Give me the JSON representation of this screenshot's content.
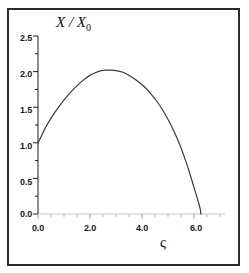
{
  "figure": {
    "background_color": "#ffffff",
    "frame_color": "#2b2b2b",
    "axis_color": "#1c1c1c",
    "xaxis_color": "#b9b9b9",
    "curve_color": "#3a3a3a"
  },
  "chart_data": {
    "type": "line",
    "title": "",
    "subtitle": "",
    "xlabel": "ς",
    "ylabel": "X / X₀",
    "xlim": [
      0.0,
      6.6
    ],
    "ylim": [
      0.0,
      2.5
    ],
    "xticks": [
      0.0,
      2.0,
      4.0,
      6.0
    ],
    "xtick_labels": [
      "0.0",
      "2.0",
      "4.0",
      "6.0"
    ],
    "xminor_step": 0.5,
    "yticks": [
      0.0,
      0.5,
      1.0,
      1.5,
      2.0,
      2.5
    ],
    "ytick_labels": [
      "0.0",
      "0.5",
      "1.0",
      "1.5",
      "2.0",
      "2.5"
    ],
    "yminor_step": 0.25,
    "grid": false,
    "legend": null,
    "legend_position": "none",
    "annotations": [],
    "series": [
      {
        "name": "X / X₀",
        "x": [
          0.0,
          0.15,
          0.3,
          0.45,
          0.6,
          0.8,
          1.0,
          1.2,
          1.4,
          1.6,
          1.8,
          2.0,
          2.2,
          2.4,
          2.6,
          2.8,
          3.0,
          3.2,
          3.4,
          3.6,
          3.8,
          4.0,
          4.2,
          4.4,
          4.6,
          4.8,
          5.0,
          5.2,
          5.35,
          5.5,
          5.6,
          5.68,
          5.73,
          5.75
        ],
        "y": [
          1.0,
          1.12,
          1.24,
          1.34,
          1.43,
          1.54,
          1.64,
          1.73,
          1.81,
          1.88,
          1.94,
          1.98,
          2.01,
          2.02,
          2.02,
          2.01,
          1.99,
          1.95,
          1.9,
          1.84,
          1.77,
          1.68,
          1.58,
          1.46,
          1.32,
          1.16,
          0.98,
          0.76,
          0.58,
          0.38,
          0.25,
          0.14,
          0.06,
          0.0
        ]
      }
    ],
    "notable_points": {
      "start": {
        "x": 0.0,
        "y": 1.0
      },
      "peak": {
        "x": 2.5,
        "y": 2.02
      },
      "end": {
        "x": 5.75,
        "y": 0.0
      }
    }
  },
  "axes": {
    "y_tick_labels": [
      "2.5",
      "2.0",
      "1.5",
      "1.0",
      "0.5",
      "0.0"
    ],
    "x_tick_labels": [
      "0.0",
      "2.0",
      "4.0",
      "6.0"
    ],
    "y_axis_title_main": "X / X",
    "y_axis_title_sub": "0",
    "x_axis_title": "ς"
  }
}
